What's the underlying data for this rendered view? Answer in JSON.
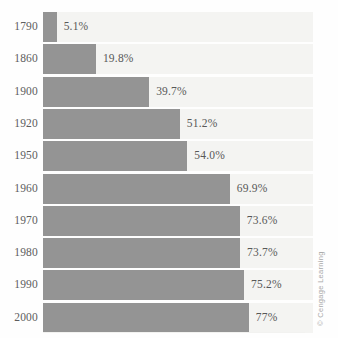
{
  "figure": {
    "credit": "© Cengage Learning",
    "bar_color": "#949494",
    "track_color": "#f4f4f2",
    "label_color": "#5d5d5d",
    "background": "#fefefe"
  },
  "chart_data": {
    "type": "bar",
    "orientation": "horizontal",
    "title": "",
    "subtitle": "",
    "xlabel": "",
    "ylabel": "",
    "categories": [
      "1790",
      "1860",
      "1900",
      "1920",
      "1950",
      "1960",
      "1970",
      "1980",
      "1990",
      "2000"
    ],
    "values": [
      5.1,
      19.8,
      39.7,
      51.2,
      54.0,
      69.9,
      73.6,
      73.7,
      75.2,
      77
    ],
    "value_labels": [
      "5.1%",
      "19.8%",
      "39.7%",
      "51.2%",
      "54.0%",
      "69.9%",
      "73.6%",
      "73.7%",
      "75.2%",
      "77%"
    ],
    "xlim": [
      0,
      101
    ],
    "grid": false,
    "legend": null,
    "annotations": [
      "© Cengage Learning"
    ],
    "rows": [
      {
        "year": "1790",
        "value": 5.1,
        "label": "5.1%"
      },
      {
        "year": "1860",
        "value": 19.8,
        "label": "19.8%"
      },
      {
        "year": "1900",
        "value": 39.7,
        "label": "39.7%"
      },
      {
        "year": "1920",
        "value": 51.2,
        "label": "51.2%"
      },
      {
        "year": "1950",
        "value": 54.0,
        "label": "54.0%"
      },
      {
        "year": "1960",
        "value": 69.9,
        "label": "69.9%"
      },
      {
        "year": "1970",
        "value": 73.6,
        "label": "73.6%"
      },
      {
        "year": "1980",
        "value": 73.7,
        "label": "73.7%"
      },
      {
        "year": "1990",
        "value": 75.2,
        "label": "75.2%"
      },
      {
        "year": "2000",
        "value": 77,
        "label": "77%"
      }
    ]
  }
}
